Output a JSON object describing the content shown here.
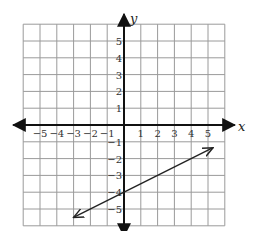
{
  "chart_data": {
    "type": "line",
    "title": "",
    "xlabel": "x",
    "ylabel": "y",
    "xlim": [
      -6,
      6
    ],
    "ylim": [
      -6,
      6
    ],
    "grid": true,
    "x_ticks": [
      "-5",
      "-4",
      "-3",
      "-2",
      "-1",
      "1",
      "2",
      "3",
      "4",
      "5"
    ],
    "y_ticks": [
      "5",
      "4",
      "3",
      "2",
      "1",
      "-1",
      "-2",
      "-3",
      "-4",
      "-5"
    ],
    "series": [
      {
        "name": "line",
        "slope": 0.5,
        "y_intercept": -4,
        "x": [
          -3,
          0,
          2,
          4,
          5.3
        ],
        "y": [
          -5.5,
          -4,
          -3,
          -2,
          -1.35
        ],
        "arrows_both_ends": true
      }
    ]
  },
  "labels": {
    "x_axis": "x",
    "y_axis": "y",
    "x_ticks": [
      {
        "v": -5,
        "t": "−5"
      },
      {
        "v": -4,
        "t": "−4"
      },
      {
        "v": -3,
        "t": "−3"
      },
      {
        "v": -2,
        "t": "−2"
      },
      {
        "v": -1,
        "t": "−1"
      },
      {
        "v": 1,
        "t": "1"
      },
      {
        "v": 2,
        "t": "2"
      },
      {
        "v": 3,
        "t": "3"
      },
      {
        "v": 4,
        "t": "4"
      },
      {
        "v": 5,
        "t": "5"
      }
    ],
    "y_ticks": [
      {
        "v": 5,
        "t": "5"
      },
      {
        "v": 4,
        "t": "4"
      },
      {
        "v": 3,
        "t": "3"
      },
      {
        "v": 2,
        "t": "2"
      },
      {
        "v": 1,
        "t": "1"
      },
      {
        "v": -1,
        "t": "−1"
      },
      {
        "v": -2,
        "t": "−2"
      },
      {
        "v": -3,
        "t": "−3"
      },
      {
        "v": -4,
        "t": "−4"
      },
      {
        "v": -5,
        "t": "−5"
      }
    ]
  }
}
